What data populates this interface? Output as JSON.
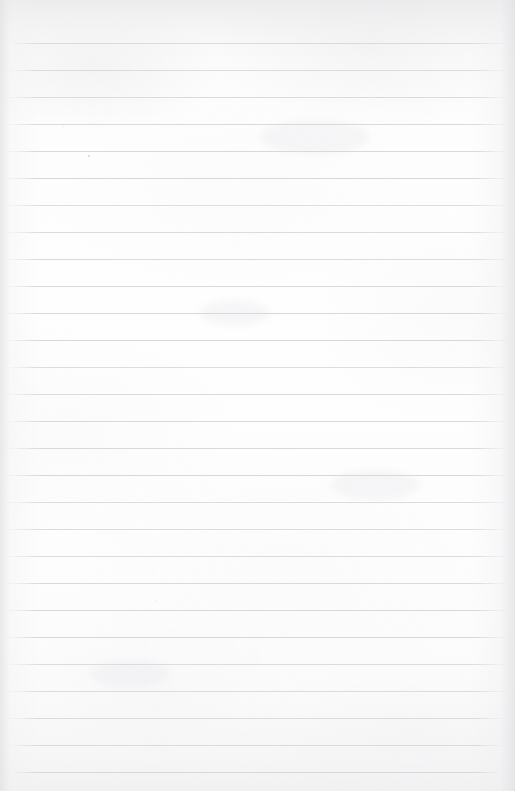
{
  "document": {
    "type": "scanned-ruled-notebook-page",
    "title": "Blank lined notebook page (scan)",
    "page_width": 515,
    "page_height": 791,
    "orientation": "portrait",
    "content_state": "blank",
    "visible_text_note": "No legible body text; only extremely faint ghost/bleed-through writing at the top"
  },
  "paper": {
    "background_color": "#fefefe",
    "top_band_color": "#ececed",
    "bottom_band_color": "#f1f1f2",
    "edge_shadow_color": "#e2e2e4",
    "has_left_margin_rule": false,
    "has_right_margin_rule": false
  },
  "ruling": {
    "line_color": "#d4d6d9",
    "line_thickness_px": 1,
    "spacing_px": 27,
    "left_inset_px": 6,
    "right_inset_px": 8,
    "first_line_y": 43,
    "line_count": 28,
    "line_positions": [
      43,
      70,
      97,
      124,
      151,
      178,
      205,
      232,
      259,
      286,
      313,
      340,
      367,
      394,
      421,
      448,
      475,
      502,
      529,
      556,
      583,
      610,
      637,
      664,
      691,
      718,
      745,
      772
    ]
  },
  "ghost_text": {
    "note": "Illegible faint impression of handwriting, rendered as indistinct strokes",
    "line_1": "           ",
    "line_2": "         ",
    "color": "#e4e4e7",
    "opacity": 0.62
  },
  "artifacts": {
    "specks": [
      {
        "x": 88,
        "y": 155,
        "size": 1.6
      },
      {
        "x": 88,
        "y": 156,
        "size": 1.2
      },
      {
        "x": 63,
        "y": 126,
        "size": 0.9
      },
      {
        "x": 413,
        "y": 367,
        "size": 1.0
      },
      {
        "x": 156,
        "y": 600,
        "size": 0.9
      },
      {
        "x": 476,
        "y": 151,
        "size": 0.8
      }
    ],
    "smudges": [
      {
        "x": 200,
        "y": 300,
        "w": 70,
        "h": 26
      },
      {
        "x": 330,
        "y": 470,
        "w": 90,
        "h": 30
      },
      {
        "x": 90,
        "y": 660,
        "w": 80,
        "h": 28
      },
      {
        "x": 260,
        "y": 120,
        "w": 110,
        "h": 34
      }
    ]
  }
}
